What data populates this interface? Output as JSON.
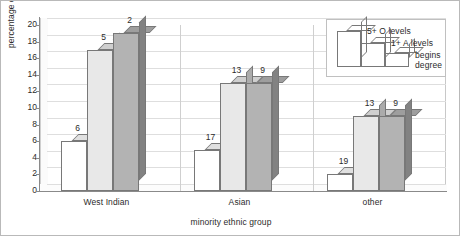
{
  "chart_data": {
    "type": "bar",
    "title": "",
    "subtitle": "",
    "xlabel": "minority ethnic group",
    "ylabel": "percentage of group",
    "categories": [
      "West Indian",
      "Asian",
      "other"
    ],
    "series": [
      {
        "name": "5+ O levels",
        "values": [
          6,
          5,
          2
        ],
        "color": "#ffffff"
      },
      {
        "name": "1+ A levels",
        "values": [
          17,
          13,
          9
        ],
        "color": "#e8e8e8"
      },
      {
        "name": "begins degree",
        "values": [
          19,
          13,
          9
        ],
        "color": "#b3b3b3"
      }
    ],
    "series_by_category": [
      {
        "category": "West Indian",
        "values": [
          6,
          5,
          2
        ]
      },
      {
        "category": "Asian",
        "values": [
          17,
          13,
          9
        ]
      },
      {
        "category": "other",
        "values": [
          19,
          13,
          9
        ]
      }
    ],
    "ylim": [
      0,
      20
    ],
    "ytick_step": 2,
    "yticks": [
      0,
      2,
      4,
      6,
      8,
      10,
      12,
      14,
      16,
      18,
      20
    ],
    "ytick_labels": [
      "0",
      "2",
      "4",
      "6",
      "8",
      "10",
      "12",
      "14",
      "16",
      "18",
      "20"
    ],
    "grid": true,
    "grid_axis": "y",
    "legend_position": "top-right",
    "style": "3d-bar",
    "data_labels": true,
    "data_label_values": [
      [
        "6",
        "5",
        "2"
      ],
      [
        "17",
        "13",
        "9"
      ],
      [
        "19",
        "13",
        "9"
      ]
    ]
  },
  "legend": {
    "entries": [
      {
        "label": "5+ O levels"
      },
      {
        "label": "1+ A levels"
      },
      {
        "label": "begins\ndegree"
      }
    ]
  },
  "axes": {
    "y_title": "percentage of group",
    "x_title": "minority ethnic group"
  }
}
